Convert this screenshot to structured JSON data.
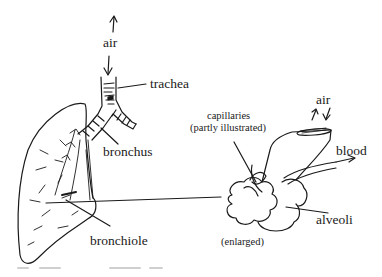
{
  "diagram": {
    "labels": {
      "air_top": "air",
      "trachea": "trachea",
      "bronchus": "bronchus",
      "bronchiole": "bronchiole",
      "capillaries_line1": "capillaries",
      "capillaries_line2": "(partly illustrated)",
      "air_right": "air",
      "blood": "blood",
      "alveoli": "alveoli",
      "enlarged": "(enlarged)"
    },
    "colors": {
      "ink": "#1a1a1a",
      "background": "#ffffff"
    }
  }
}
